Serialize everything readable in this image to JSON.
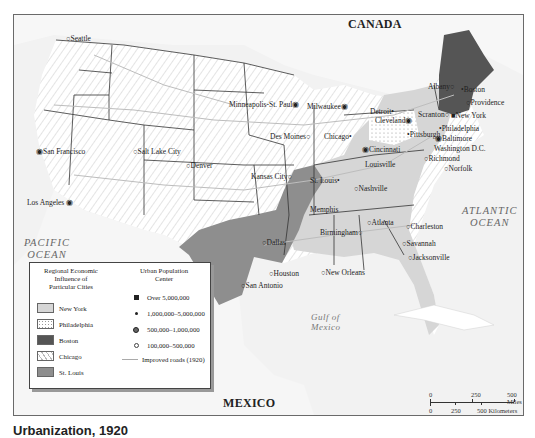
{
  "map": {
    "countries": {
      "canada": "CANADA",
      "mexico": "MEXICO"
    },
    "oceans": {
      "pacific": [
        "PACIFIC",
        "OCEAN"
      ],
      "atlantic": [
        "ATLANTIC",
        "OCEAN"
      ],
      "gulf": [
        "Gulf of",
        "Mexico"
      ]
    },
    "cities": [
      {
        "name": "Seattle",
        "size": "100,000-500,000"
      },
      {
        "name": "San Francisco",
        "size": "500,000-1,000,000"
      },
      {
        "name": "Los Angeles",
        "size": "500,000-1,000,000"
      },
      {
        "name": "Salt Lake City",
        "size": "100,000-500,000"
      },
      {
        "name": "Denver",
        "size": "100,000-500,000"
      },
      {
        "name": "Minneapolis-St. Paul",
        "size": "500,000-1,000,000"
      },
      {
        "name": "Des Moines",
        "size": "100,000-500,000"
      },
      {
        "name": "Kansas City",
        "size": "100,000-500,000"
      },
      {
        "name": "Milwaukee",
        "size": "500,000-1,000,000"
      },
      {
        "name": "Chicago",
        "size": "1,000,000-5,000,000"
      },
      {
        "name": "St. Louis",
        "size": "1,000,000-5,000,000"
      },
      {
        "name": "Detroit",
        "size": "1,000,000-5,000,000"
      },
      {
        "name": "Cleveland",
        "size": "500,000-1,000,000"
      },
      {
        "name": "Cincinnati",
        "size": "500,000-1,000,000"
      },
      {
        "name": "Louisville",
        "size": "100,000-500,000"
      },
      {
        "name": "Pittsburgh",
        "size": "1,000,000-5,000,000"
      },
      {
        "name": "Scranton",
        "size": "100,000-500,000"
      },
      {
        "name": "Albany",
        "size": "100,000-500,000"
      },
      {
        "name": "Boston",
        "size": "1,000,000-5,000,000"
      },
      {
        "name": "Providence",
        "size": "100,000-500,000"
      },
      {
        "name": "New York",
        "size": "Over 5,000,000"
      },
      {
        "name": "Philadelphia",
        "size": "1,000,000-5,000,000"
      },
      {
        "name": "Baltimore",
        "size": "500,000-1,000,000"
      },
      {
        "name": "Washington D.C.",
        "size": "100,000-500,000"
      },
      {
        "name": "Richmond",
        "size": "100,000-500,000"
      },
      {
        "name": "Norfolk",
        "size": "100,000-500,000"
      },
      {
        "name": "Nashville",
        "size": "100,000-500,000"
      },
      {
        "name": "Memphis",
        "size": "100,000-500,000"
      },
      {
        "name": "Birmingham",
        "size": "100,000-500,000"
      },
      {
        "name": "Atlanta",
        "size": "100,000-500,000"
      },
      {
        "name": "Charleston",
        "size": "100,000-500,000"
      },
      {
        "name": "Savannah",
        "size": "100,000-500,000"
      },
      {
        "name": "Jacksonville",
        "size": "100,000-500,000"
      },
      {
        "name": "Dallas",
        "size": "100,000-500,000"
      },
      {
        "name": "Houston",
        "size": "100,000-500,000"
      },
      {
        "name": "San Antonio",
        "size": "100,000-500,000"
      },
      {
        "name": "New Orleans",
        "size": "100,000-500,000"
      }
    ]
  },
  "legend": {
    "regional_title": [
      "Regional Economic",
      "Influence of",
      "Particular Cities"
    ],
    "regions": [
      {
        "label": "New York",
        "color": "#d6d6d6",
        "pattern": "solid"
      },
      {
        "label": "Philadelphia",
        "color": "#ffffff",
        "pattern": "dotted"
      },
      {
        "label": "Boston",
        "color": "#555555",
        "pattern": "solid"
      },
      {
        "label": "Chicago",
        "color": "#ffffff",
        "pattern": "hatched"
      },
      {
        "label": "St. Louis",
        "color": "#8e8e8e",
        "pattern": "solid"
      }
    ],
    "population_title": [
      "Urban Population",
      "Center"
    ],
    "population": [
      {
        "label": "Over 5,000,000",
        "symbol": "filled-square"
      },
      {
        "label": "1,000,000–5,000,000",
        "symbol": "small-dot"
      },
      {
        "label": "500,000–1,000,000",
        "symbol": "filled-circle"
      },
      {
        "label": "100,000–500,000",
        "symbol": "open-circle"
      },
      {
        "label": "Improved roads (1920)",
        "symbol": "line"
      }
    ]
  },
  "scale": {
    "miles": [
      "0",
      "250",
      "500 Miles"
    ],
    "kilometers": [
      "0",
      "250",
      "500 Kilometers"
    ]
  },
  "caption": "Urbanization, 1920"
}
